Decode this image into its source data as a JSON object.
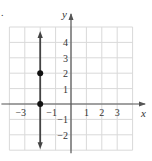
{
  "chart_data": {
    "type": "line",
    "title": "",
    "xlabel": "x",
    "ylabel": "y",
    "xlim": [
      -4,
      4
    ],
    "ylim": [
      -3,
      5
    ],
    "grid": true,
    "x_ticks": [
      -3,
      -1,
      1,
      2,
      3
    ],
    "y_ticks": [
      4,
      3,
      2,
      1,
      -1,
      -2
    ],
    "x_tick_labels": [
      "−3",
      "−1",
      "1",
      "2",
      "3"
    ],
    "y_tick_labels": [
      "4",
      "3",
      "2",
      "1",
      "−1",
      "−2"
    ],
    "series": [
      {
        "name": "x = -2",
        "kind": "vertical-line",
        "x": -2,
        "arrows": "both",
        "color": "#444444"
      }
    ],
    "points": [
      {
        "x": -2,
        "y": 0
      },
      {
        "x": -2,
        "y": 2
      }
    ],
    "colors": {
      "grid": "#d9d9d9",
      "axis": "#555555",
      "line": "#444444",
      "point": "#111111"
    }
  },
  "labels": {
    "x_axis": "x",
    "y_axis": "y",
    "corner_mark": "."
  }
}
